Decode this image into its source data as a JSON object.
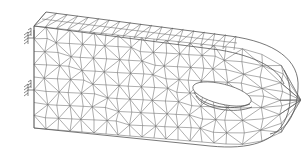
{
  "figure": {
    "colors": {
      "background": "#ffffff",
      "mesh_line": "#6a6a6a",
      "outline": "#555555"
    },
    "supports": [
      {
        "name": "fixed-support-upper",
        "x": 30,
        "y": 40
      },
      {
        "name": "fixed-support-lower",
        "x": 30,
        "y": 92
      }
    ],
    "hole": {
      "cx": 222,
      "cy": 96,
      "rx": 30,
      "ry": 11,
      "rotation": 15
    },
    "labels": []
  }
}
